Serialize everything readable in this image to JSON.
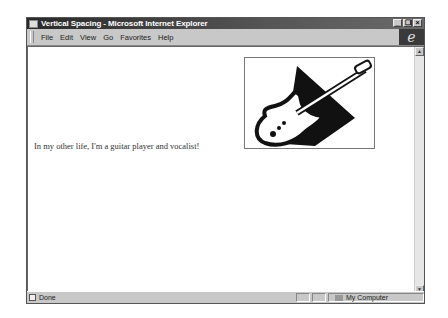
{
  "window": {
    "title": "Vertical Spacing - Microsoft Internet Explorer",
    "controls": {
      "minimize": "_",
      "restore": "❐",
      "close": "×"
    }
  },
  "menubar": {
    "items": [
      {
        "label": "File"
      },
      {
        "label": "Edit"
      },
      {
        "label": "View"
      },
      {
        "label": "Go"
      },
      {
        "label": "Favorites"
      },
      {
        "label": "Help"
      }
    ],
    "logo_glyph": "e"
  },
  "content": {
    "image_alt": "guitar-illustration",
    "text": "In my other life, I'm a guitar player and vocalist!"
  },
  "scrollbar": {
    "up": "▲",
    "down": "▼"
  },
  "statusbar": {
    "status": "Done",
    "zone": "My Computer"
  }
}
